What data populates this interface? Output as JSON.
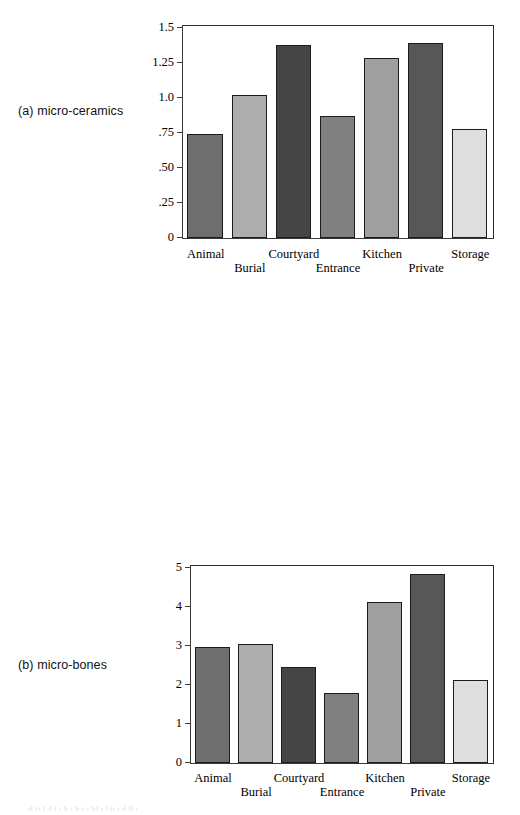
{
  "figure": {
    "background": "#ffffff",
    "bar_border_color": "#1c1c1c",
    "axis_color": "#3a3a3a",
    "footer_fragment": "d fi l d l i h i h i i ld i l b i d ll i"
  },
  "categories": [
    "Animal",
    "Burial",
    "Courtyard",
    "Entrance",
    "Kitchen",
    "Private",
    "Storage"
  ],
  "bar_colors": [
    "#6e6e6e",
    "#adadad",
    "#454545",
    "#808080",
    "#9f9f9f",
    "#575757",
    "#dedede"
  ],
  "panels": [
    {
      "id": "a",
      "label": "(a) micro-ceramics",
      "ylabels": [
        "1.5",
        "1.25",
        "1.0",
        ".75",
        ".50",
        ".25",
        "0"
      ]
    },
    {
      "id": "b",
      "label": "(b) micro-bones",
      "ylabels": [
        "5",
        "4",
        "3",
        "2",
        "1",
        "0"
      ]
    },
    {
      "id": "c",
      "label": "(c) micro-lithics",
      "ylabels": [
        "8",
        "6",
        "4",
        "2",
        "0"
      ]
    }
  ],
  "chart_data": [
    {
      "type": "bar",
      "title": "(a) micro-ceramics",
      "categories": [
        "Animal",
        "Burial",
        "Courtyard",
        "Entrance",
        "Kitchen",
        "Private",
        "Storage"
      ],
      "values": [
        0.74,
        1.02,
        1.37,
        0.87,
        1.28,
        1.385,
        0.775
      ],
      "xlabel": "",
      "ylabel": "",
      "ylim": [
        0,
        1.5
      ],
      "yticks": [
        0,
        0.25,
        0.5,
        0.75,
        1.0,
        1.25,
        1.5
      ],
      "ytick_labels": [
        "0",
        ".25",
        ".50",
        ".75",
        "1.0",
        "1.25",
        "1.5"
      ],
      "grid": false,
      "legend": "none"
    },
    {
      "type": "bar",
      "title": "(b) micro-bones",
      "categories": [
        "Animal",
        "Burial",
        "Courtyard",
        "Entrance",
        "Kitchen",
        "Private",
        "Storage"
      ],
      "values": [
        2.96,
        3.05,
        2.45,
        1.79,
        4.12,
        4.82,
        2.12
      ],
      "xlabel": "",
      "ylabel": "",
      "ylim": [
        0,
        5
      ],
      "yticks": [
        0,
        1,
        2,
        3,
        4,
        5
      ],
      "ytick_labels": [
        "0",
        "1",
        "2",
        "3",
        "4",
        "5"
      ],
      "grid": false,
      "legend": "none"
    },
    {
      "type": "bar",
      "title": "(c) micro-lithics",
      "categories": [
        "Animal",
        "Burial",
        "Courtyard",
        "Entrance",
        "Kitchen",
        "Private",
        "Storage"
      ],
      "values": [
        0.2,
        2.9,
        3.5,
        3.27,
        2.99,
        6.35,
        3.02
      ],
      "xlabel": "",
      "ylabel": "",
      "ylim": [
        0,
        8
      ],
      "yticks": [
        0,
        2,
        4,
        6,
        8
      ],
      "ytick_labels": [
        "0",
        "2",
        "4",
        "6",
        "8"
      ],
      "grid": false,
      "legend": "none"
    }
  ]
}
